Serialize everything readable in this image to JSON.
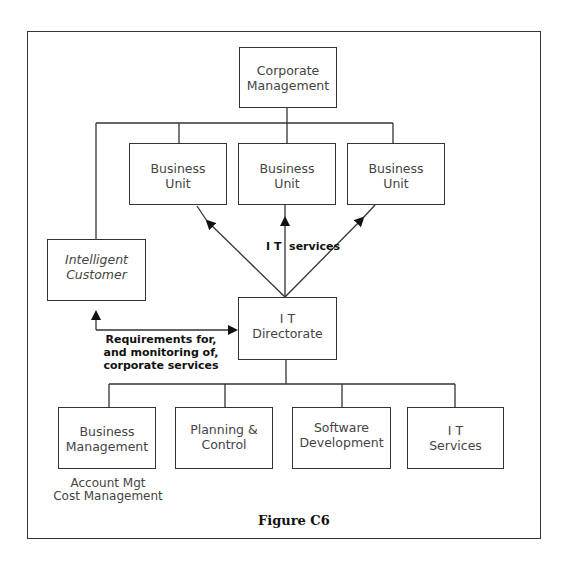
{
  "diagram": {
    "nodes": {
      "corporate": [
        "Corporate",
        "Management"
      ],
      "bu1": [
        "Business",
        "Unit"
      ],
      "bu2": [
        "Business",
        "Unit"
      ],
      "bu3": [
        "Business",
        "Unit"
      ],
      "intelligent_customer": [
        "Intelligent",
        "Customer"
      ],
      "it_directorate": [
        "I T",
        "Directorate"
      ],
      "business_mgmt": [
        "Business",
        "Management"
      ],
      "planning": [
        "Planning &",
        "Control"
      ],
      "software": [
        "Software",
        "Development"
      ],
      "it_services": [
        "I T",
        "Services"
      ]
    },
    "labels": {
      "it_services_arrow": "I T  services",
      "requirements": [
        "Requirements for,",
        "and monitoring of,",
        "corporate services"
      ],
      "business_mgmt_sub": [
        "Account Mgt",
        "Cost Management"
      ]
    },
    "caption": "Figure C6",
    "colors": {
      "line": "#333333",
      "background": "#ffffff"
    }
  }
}
